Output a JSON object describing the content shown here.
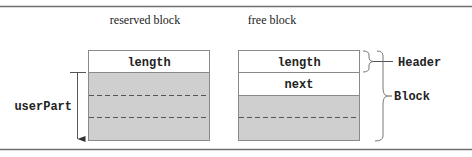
{
  "diagram": {
    "colors": {
      "rule": "#6e6e6e",
      "outline": "#8a8a8a",
      "fill_gray": "#cfcfcf",
      "fill_white": "#ffffff",
      "dash": "#555555",
      "text": "#222222"
    },
    "reserved_block": {
      "title": "reserved block",
      "header_field": "length",
      "user_part_label": "userPart",
      "dashed_divisions": 2
    },
    "free_block": {
      "title": "free block",
      "header_field": "length",
      "next_field": "next",
      "dashed_divisions": 1
    },
    "annotations": {
      "header_label": "Header",
      "block_label": "Block"
    }
  }
}
